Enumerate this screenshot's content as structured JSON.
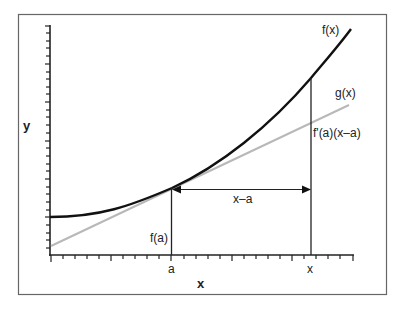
{
  "diagram": {
    "axis_labels": {
      "x": "x",
      "y": "y"
    },
    "tick_labels": {
      "a": "a",
      "x": "x"
    },
    "curves": {
      "f": {
        "label": "f(x)",
        "color": "#111111"
      },
      "g": {
        "label": "g(x)",
        "color": "#b8b8b8"
      }
    },
    "annotations": {
      "fa": "f(a)",
      "increment": "x–a",
      "rise": "f'(a)(x–a)"
    },
    "colors": {
      "frame": "#666666",
      "axis": "#222222",
      "tangent": "#b8b8b8",
      "curve": "#111111"
    }
  }
}
